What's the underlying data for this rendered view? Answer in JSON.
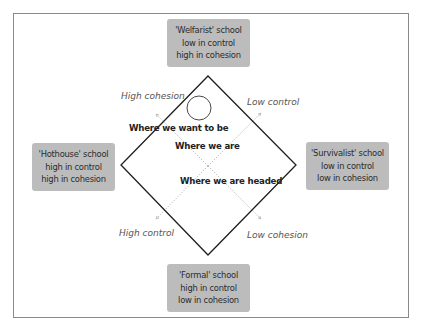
{
  "diagram": {
    "schools": {
      "welfarist": {
        "name": "'Welfarist' school",
        "control": "low in control",
        "cohesion": "high in cohesion"
      },
      "hothouse": {
        "name": "'Hothouse' school",
        "control": "high in control",
        "cohesion": "high in cohesion"
      },
      "survivalist": {
        "name": "'Survivalist' school",
        "control": "low in control",
        "cohesion": "low in cohesion"
      },
      "formal": {
        "name": "'Formal' school",
        "control": "high in control",
        "cohesion": "low in cohesion"
      }
    },
    "axes": {
      "high_cohesion": "High cohesion",
      "low_control": "Low control",
      "high_control": "High control",
      "low_cohesion": "Low cohesion"
    },
    "positions": {
      "want_to_be": "Where we want to be",
      "are": "Where we are",
      "headed": "Where we are headed"
    },
    "colors": {
      "box_fill": "#bcbcbc",
      "diamond_stroke": "#1e1e1e",
      "axis_stroke": "#9a9a9a",
      "frame_stroke": "#8a8a8a"
    }
  }
}
